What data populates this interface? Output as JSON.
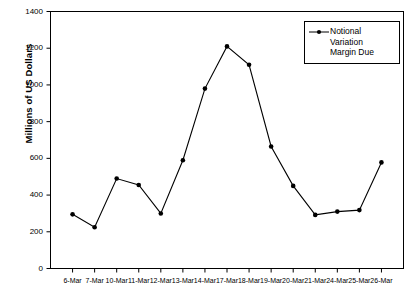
{
  "chart_data": {
    "type": "line",
    "title": "",
    "xlabel": "",
    "ylabel": "Millions of US Dollars",
    "ylim": [
      0,
      1400
    ],
    "yticks": [
      0,
      200,
      400,
      600,
      800,
      1000,
      1200,
      1400
    ],
    "grid": false,
    "legend_position": "top-right",
    "categories": [
      "6-Mar",
      "7-Mar",
      "10-Mar",
      "11-Mar",
      "12-Mar",
      "13-Mar",
      "14-Mar",
      "17-Mar",
      "18-Mar",
      "19-Mar",
      "20-Mar",
      "21-Mar",
      "24-Mar",
      "25-Mar",
      "26-Mar"
    ],
    "series": [
      {
        "name": "Notional Variation Margin Due",
        "values": [
          295,
          225,
          490,
          455,
          300,
          590,
          980,
          1210,
          1110,
          665,
          450,
          292,
          310,
          318,
          578
        ],
        "color": "#000000",
        "marker": "circle"
      }
    ]
  },
  "legend": {
    "entries": [
      {
        "label": "Notional\nVariation\nMargin Due",
        "symbol": "line-with-marker"
      }
    ]
  },
  "axes": {
    "y_title": "Millions of US Dollars",
    "y_tick_labels": [
      "1400",
      "1200",
      "1000",
      "800",
      "600",
      "400",
      "200",
      "0"
    ],
    "x_tick_labels": [
      "6-Mar",
      "7-Mar",
      "10-Mar",
      "11-Mar",
      "12-Mar",
      "13-Mar",
      "14-Mar",
      "17-Mar",
      "18-Mar",
      "19-Mar",
      "20-Mar",
      "21-Mar",
      "24-Mar",
      "25-Mar",
      "26-Mar"
    ]
  }
}
